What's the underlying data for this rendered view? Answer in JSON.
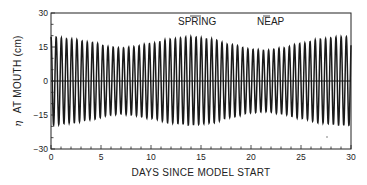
{
  "chart_data": {
    "type": "line",
    "title": "",
    "xlabel": "DAYS SINCE MODEL START",
    "ylabel_symbol": "η",
    "ylabel": "AT MOUTH (cm)",
    "xlim": [
      0,
      30
    ],
    "ylim": [
      -30,
      30
    ],
    "x_ticks": [
      0,
      5,
      10,
      15,
      20,
      25,
      30
    ],
    "x_minor_step": 1,
    "y_ticks": [
      -30,
      -15,
      0,
      15,
      30
    ],
    "y_tick_labels": [
      "−30",
      "−15",
      "0",
      "15",
      "30"
    ],
    "y_minor_step": 5,
    "grid": false,
    "zero_line": true,
    "series": [
      {
        "name": "eta_at_mouth",
        "description": "Semi-diurnal tidal elevation with spring–neap modulation",
        "cycles_per_day": 1.93,
        "envelope_days": [
          0,
          2,
          4,
          6,
          7,
          8,
          10,
          12,
          14,
          16,
          18,
          20,
          21.5,
          23,
          25,
          27,
          29,
          30
        ],
        "envelope_amplitude_cm": [
          19.5,
          18.5,
          17,
          15,
          14.5,
          15,
          16.5,
          18.5,
          19.5,
          18.5,
          16,
          14,
          13.5,
          14.5,
          16.5,
          18.5,
          19.5,
          19.5
        ]
      }
    ],
    "annotations": [
      {
        "text": "SPRING",
        "x_day": 13.0,
        "y_cm": 27
      },
      {
        "text": "NEAP",
        "x_day": 21.8,
        "y_cm": 27
      }
    ]
  }
}
